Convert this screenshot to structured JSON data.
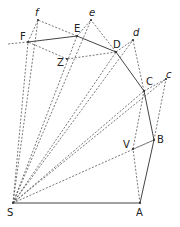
{
  "diagram": {
    "points": {
      "S": {
        "label": "S",
        "x": 13,
        "y": 203,
        "lx": 7,
        "ly": 216,
        "italic": false
      },
      "A": {
        "label": "A",
        "x": 140,
        "y": 203,
        "lx": 136,
        "ly": 216,
        "italic": false
      },
      "B": {
        "label": "B",
        "x": 154,
        "y": 140,
        "lx": 157,
        "ly": 143,
        "italic": false
      },
      "V": {
        "label": "V",
        "x": 133,
        "y": 149,
        "lx": 123,
        "ly": 148,
        "italic": false
      },
      "C": {
        "label": "C",
        "x": 144,
        "y": 91,
        "lx": 146,
        "ly": 85,
        "italic": false
      },
      "c": {
        "label": "c",
        "x": 166,
        "y": 79,
        "lx": 166,
        "ly": 78,
        "italic": true
      },
      "D": {
        "label": "D",
        "x": 116,
        "y": 52,
        "lx": 113,
        "ly": 48,
        "italic": false
      },
      "d": {
        "label": "d",
        "x": 133,
        "y": 40,
        "lx": 133,
        "ly": 36,
        "italic": true
      },
      "E": {
        "label": "E",
        "x": 77,
        "y": 36,
        "lx": 74,
        "ly": 32,
        "italic": false
      },
      "e": {
        "label": "e",
        "x": 91,
        "y": 20,
        "lx": 89,
        "ly": 16,
        "italic": true
      },
      "F": {
        "label": "F",
        "x": 28,
        "y": 42,
        "lx": 20,
        "ly": 40,
        "italic": false
      },
      "f": {
        "label": "f",
        "x": 38,
        "y": 20,
        "lx": 35,
        "ly": 16,
        "italic": true
      },
      "Z": {
        "label": "Z",
        "x": 67,
        "y": 59,
        "lx": 57,
        "ly": 66,
        "italic": false
      }
    },
    "solid_edges": [
      [
        "S",
        "A"
      ],
      [
        "A",
        "B"
      ],
      [
        "B",
        "C"
      ],
      [
        "C",
        "D"
      ],
      [
        "D",
        "E"
      ],
      [
        "E",
        "F"
      ]
    ],
    "dashed_edges": [
      [
        "S",
        "B"
      ],
      [
        "S",
        "C"
      ],
      [
        "S",
        "c"
      ],
      [
        "S",
        "D"
      ],
      [
        "S",
        "d"
      ],
      [
        "S",
        "E"
      ],
      [
        "S",
        "e"
      ],
      [
        "S",
        "F"
      ],
      [
        "S",
        "f"
      ],
      [
        "A",
        "V"
      ],
      [
        "V",
        "B"
      ],
      [
        "B",
        "c"
      ],
      [
        "C",
        "c"
      ],
      [
        "C",
        "d"
      ],
      [
        "D",
        "d"
      ],
      [
        "D",
        "e"
      ],
      [
        "E",
        "e"
      ],
      [
        "E",
        "f"
      ],
      [
        "F",
        "f"
      ],
      [
        "D",
        "Z"
      ],
      [
        "Z",
        "F"
      ],
      [
        "F",
        "F_ext"
      ],
      [
        "V",
        "C"
      ]
    ],
    "extra_points": {
      "F_ext": {
        "x": 8,
        "y": 44
      }
    }
  }
}
